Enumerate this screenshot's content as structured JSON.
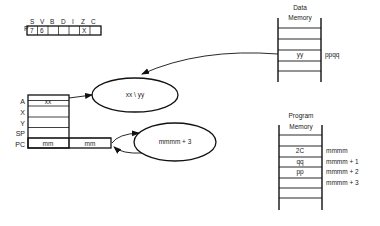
{
  "flags": {
    "label": "P",
    "bits": [
      "S",
      "V",
      "B",
      "D",
      "I",
      "Z",
      "C"
    ],
    "cells": [
      "7",
      "6",
      "",
      "",
      "",
      "X",
      ""
    ]
  },
  "registers": {
    "labels": [
      "A",
      "X",
      "Y",
      "SP",
      "PC"
    ],
    "a_value": "xx",
    "pc_high": "mm",
    "pc_low": "mm"
  },
  "operation": {
    "and_ellipse": "xx \\ yy",
    "pc_ellipse": "mmmm + 3"
  },
  "data_memory": {
    "title_line1": "Data",
    "title_line2": "Memory",
    "cell_value": "yy",
    "address": "ppqq"
  },
  "program_memory": {
    "title_line1": "Program",
    "title_line2": "Memory",
    "cells": [
      "2C",
      "qq",
      "pp",
      ""
    ],
    "addresses": [
      "mmmm",
      "mmmm + 1",
      "mmmm + 2",
      "mmmm + 3"
    ]
  }
}
